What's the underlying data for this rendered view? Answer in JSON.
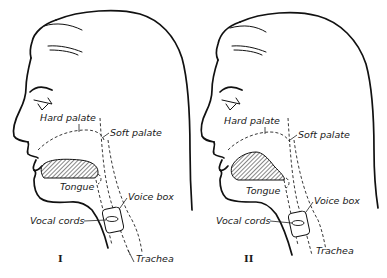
{
  "figure": {
    "panels": [
      {
        "id": "I",
        "numeral": "I",
        "labels": {
          "hard_palate": "Hard palate",
          "soft_palate": "Soft palate",
          "tongue": "Tongue",
          "voice_box": "Voice box",
          "vocal_cords": "Vocal cords",
          "trachea": "Trachea"
        }
      },
      {
        "id": "II",
        "numeral": "II",
        "labels": {
          "hard_palate": "Hard palate",
          "soft_palate": "Soft palate",
          "tongue": "Tongue",
          "voice_box": "Voice box",
          "vocal_cords": "Vocal cords",
          "trachea": "Trachea"
        }
      }
    ],
    "colors": {
      "ink": "#111111",
      "background": "#ffffff"
    }
  }
}
